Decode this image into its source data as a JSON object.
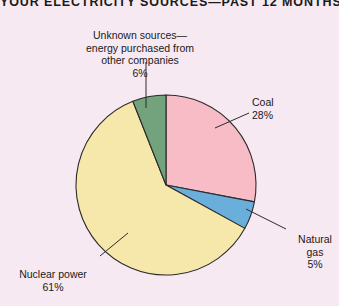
{
  "chart_data": {
    "type": "pie",
    "title": "YOUR ELECTRICITY SOURCES—PAST 12 MONTHS",
    "xlabel": "",
    "ylabel": "",
    "legend_position": "none",
    "grid": false,
    "total": 100,
    "unit": "%",
    "categories": [
      "Coal",
      "Natural gas",
      "Nuclear power",
      "Unknown sources—energy purchased from other companies"
    ],
    "values": [
      28,
      5,
      61,
      6
    ],
    "slices": [
      {
        "name": "Coal",
        "label": "Coal",
        "value": 28,
        "value_label": "28%",
        "color": "#f7bcc6",
        "start_angle": 0,
        "end_angle": 100.8
      },
      {
        "name": "Natural gas",
        "label": "Natural\ngas",
        "value": 5,
        "value_label": "5%",
        "color": "#6aaedc",
        "start_angle": 100.8,
        "end_angle": 118.8
      },
      {
        "name": "Nuclear power",
        "label": "Nuclear power",
        "value": 61,
        "value_label": "61%",
        "color": "#f6e7ab",
        "start_angle": 118.8,
        "end_angle": 338.4
      },
      {
        "name": "Unknown sources",
        "label": "Unknown sources—\nenergy purchased from\nother companies",
        "value": 6,
        "value_label": "6%",
        "color": "#73a37c",
        "start_angle": 338.4,
        "end_angle": 360
      }
    ]
  },
  "chart": {
    "title": "YOUR ELECTRICITY SOURCES—PAST 12 MONTHS",
    "background_color": "#f7e9f1",
    "outline_color": "#2b2b2b",
    "labels": {
      "coal": {
        "name": "Coal",
        "percent": "28%"
      },
      "gas": {
        "name": "Natural\ngas",
        "percent": "5%"
      },
      "nuclear": {
        "name": "Nuclear power",
        "percent": "61%"
      },
      "unknown": {
        "name": "Unknown sources—\nenergy purchased from\nother companies",
        "percent": "6%"
      }
    }
  }
}
